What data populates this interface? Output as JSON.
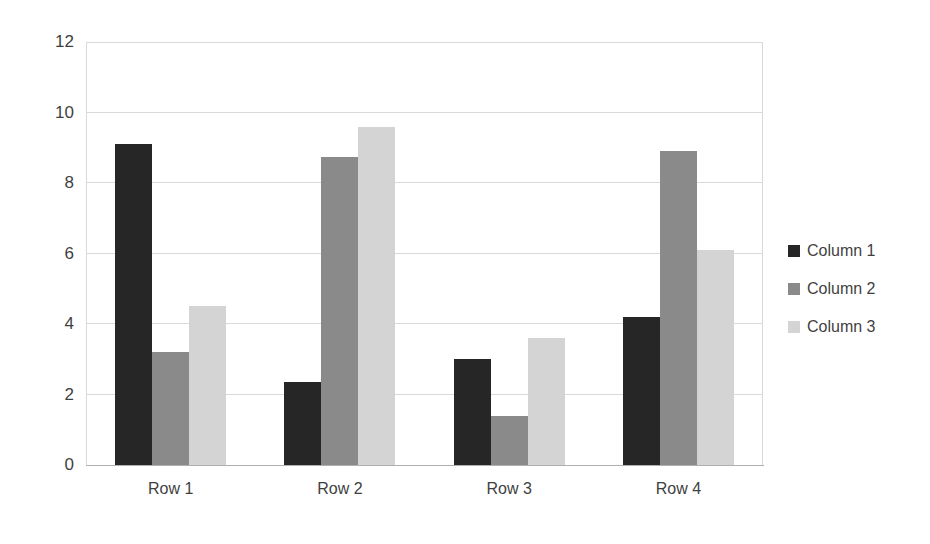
{
  "chart_data": {
    "type": "bar",
    "title": "",
    "subtitle": "",
    "xlabel": "",
    "ylabel": "",
    "categories": [
      "Row 1",
      "Row 2",
      "Row 3",
      "Row 4"
    ],
    "series": [
      {
        "name": "Column 1",
        "color": "#262626",
        "values": [
          9.1,
          2.35,
          3.0,
          4.2
        ]
      },
      {
        "name": "Column 2",
        "color": "#8a8a8a",
        "values": [
          3.2,
          8.75,
          1.4,
          8.9
        ]
      },
      {
        "name": "Column 3",
        "color": "#d4d4d4",
        "values": [
          4.5,
          9.6,
          3.6,
          6.1
        ]
      }
    ],
    "ylim": [
      0,
      12
    ],
    "yticks": [
      0,
      2,
      4,
      6,
      8,
      10,
      12
    ],
    "ytick_labels": [
      "0",
      "2",
      "4",
      "6",
      "8",
      "10",
      "12"
    ],
    "grid": true,
    "grid_color": "#d9d9d9",
    "legend": {
      "position": "right",
      "entries": [
        "Column 1",
        "Column 2",
        "Column 3"
      ]
    },
    "background_color": "#ffffff",
    "plot_border_color": "#d9d9d9"
  }
}
